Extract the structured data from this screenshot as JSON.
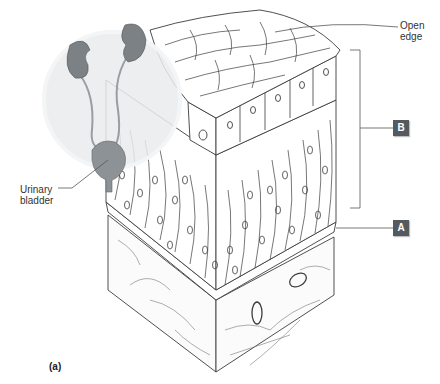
{
  "figure": {
    "panel_label": "(a)",
    "labels": {
      "open_edge": "Open edge",
      "open_edge_line1": "Open",
      "open_edge_line2": "edge",
      "urinary_bladder_line1": "Urinary",
      "urinary_bladder_line2": "bladder"
    },
    "tags": {
      "a": "A",
      "b": "B"
    },
    "colors": {
      "tag_fill": "#555a5f",
      "line": "#444444",
      "organ": "#8a8f94",
      "inset_circle": "#e9ebec"
    }
  }
}
